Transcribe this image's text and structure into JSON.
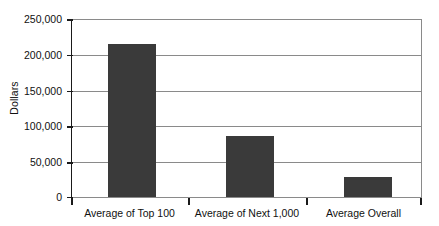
{
  "chart_data": {
    "type": "bar",
    "title": "",
    "xlabel": "",
    "ylabel": "Dollars",
    "categories": [
      "Average of Top 100",
      "Average of Next 1,000",
      "Average Overall"
    ],
    "values": [
      215000,
      85000,
      28000
    ],
    "ylim": [
      0,
      250000
    ],
    "yticks": [
      0,
      50000,
      100000,
      150000,
      200000,
      250000
    ],
    "ytick_labels": [
      "0",
      "50,000",
      "100,000",
      "150,000",
      "200,000",
      "250,000"
    ],
    "grid": true,
    "legend": "none",
    "bar_color": "#3a3a3a",
    "axis_color": "#1a1a1a",
    "grid_color": "#8a8a8a",
    "background": "#ffffff"
  }
}
